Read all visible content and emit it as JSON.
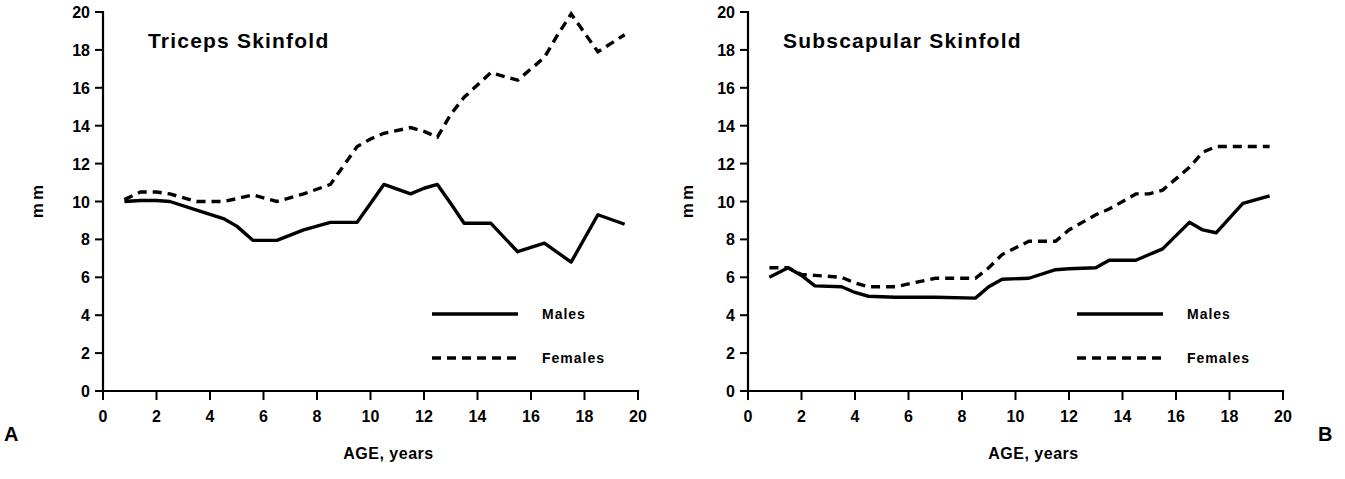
{
  "figure": {
    "panel_a_letter": "A",
    "panel_b_letter": "B"
  },
  "chart_data": [
    {
      "type": "line",
      "panel": "A",
      "title": "Triceps  Skinfold",
      "xlabel": "AGE,  years",
      "ylabel": "mm",
      "xlim": [
        0,
        20
      ],
      "ylim": [
        0,
        20
      ],
      "xticks": [
        0,
        2,
        4,
        6,
        8,
        10,
        12,
        14,
        16,
        18,
        20
      ],
      "xtick_labels": [
        "0",
        "2",
        "4",
        "6",
        "8",
        "10",
        "12",
        "14",
        "16",
        "18",
        "20"
      ],
      "yticks": [
        0,
        2,
        4,
        6,
        8,
        10,
        12,
        14,
        16,
        18,
        20
      ],
      "ytick_labels": [
        "0",
        "2",
        "4",
        "6",
        "8",
        "10",
        "12",
        "14",
        "16",
        "18",
        "20"
      ],
      "grid": false,
      "legend_position": "lower-right",
      "legend": [
        "Males",
        "Females"
      ],
      "x": [
        0.8,
        1.4,
        2.0,
        2.5,
        3.5,
        4.5,
        5.0,
        5.6,
        6.5,
        7.5,
        8.5,
        9.5,
        10.0,
        10.5,
        11.5,
        12.0,
        12.5,
        13.0,
        13.5,
        14.5,
        15.5,
        16.5,
        17.0,
        17.5,
        18.5,
        19.5
      ],
      "series": [
        {
          "name": "Males",
          "style": "solid",
          "values": [
            10.0,
            10.05,
            10.05,
            10.0,
            9.55,
            9.1,
            8.7,
            7.95,
            7.95,
            8.5,
            8.9,
            8.9,
            9.9,
            10.9,
            10.4,
            10.7,
            10.9,
            9.9,
            8.85,
            8.85,
            7.35,
            7.8,
            7.3,
            6.8,
            9.3,
            8.8
          ]
        },
        {
          "name": "Females",
          "style": "dashed",
          "values": [
            10.1,
            10.5,
            10.5,
            10.4,
            10.0,
            10.0,
            10.15,
            10.35,
            10.0,
            10.4,
            10.9,
            12.9,
            13.3,
            13.6,
            13.9,
            13.7,
            13.4,
            14.6,
            15.5,
            16.8,
            16.4,
            17.6,
            18.8,
            19.9,
            17.9,
            18.8
          ]
        }
      ]
    },
    {
      "type": "line",
      "panel": "B",
      "title": "Subscapular  Skinfold",
      "xlabel": "AGE,  years",
      "ylabel": "mm",
      "xlim": [
        0,
        20
      ],
      "ylim": [
        0,
        20
      ],
      "xticks": [
        0,
        2,
        4,
        6,
        8,
        10,
        12,
        14,
        16,
        18,
        20
      ],
      "xtick_labels": [
        "0",
        "2",
        "4",
        "6",
        "8",
        "10",
        "12",
        "14",
        "16",
        "18",
        "20"
      ],
      "yticks": [
        0,
        2,
        4,
        6,
        8,
        10,
        12,
        14,
        16,
        18,
        20
      ],
      "ytick_labels": [
        "0",
        "2",
        "4",
        "6",
        "8",
        "10",
        "12",
        "14",
        "16",
        "18",
        "20"
      ],
      "grid": false,
      "legend_position": "lower-right",
      "legend": [
        "Males",
        "Females"
      ],
      "x": [
        0.8,
        1.5,
        2.0,
        2.5,
        3.5,
        4.0,
        4.5,
        5.5,
        7.0,
        8.5,
        9.0,
        9.5,
        10.5,
        11.5,
        12.0,
        13.0,
        13.5,
        14.5,
        15.0,
        15.5,
        16.5,
        17.0,
        17.5,
        18.5,
        19.5
      ],
      "series": [
        {
          "name": "Males",
          "style": "solid",
          "values": [
            6.0,
            6.5,
            6.1,
            5.55,
            5.5,
            5.2,
            5.0,
            4.95,
            4.95,
            4.9,
            5.5,
            5.9,
            5.95,
            6.4,
            6.45,
            6.5,
            6.9,
            6.9,
            7.2,
            7.5,
            8.9,
            8.5,
            8.35,
            9.9,
            10.3
          ]
        },
        {
          "name": "Females",
          "style": "dashed",
          "values": [
            6.5,
            6.5,
            6.15,
            6.1,
            6.0,
            5.7,
            5.5,
            5.5,
            5.95,
            5.95,
            6.5,
            7.2,
            7.9,
            7.9,
            8.5,
            9.3,
            9.6,
            10.4,
            10.4,
            10.6,
            11.8,
            12.6,
            12.9,
            12.9,
            12.9
          ]
        }
      ]
    }
  ]
}
